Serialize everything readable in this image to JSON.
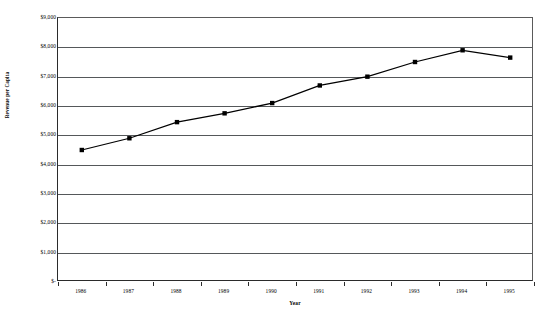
{
  "chart_data": {
    "type": "line",
    "title": "",
    "xlabel": "Year",
    "ylabel": "Revenue per Capita",
    "categories": [
      "1986",
      "1987",
      "1988",
      "1989",
      "1990",
      "1991",
      "1992",
      "1993",
      "1994",
      "1995"
    ],
    "values": [
      4500,
      4900,
      5450,
      5750,
      6100,
      6700,
      7000,
      7500,
      7900,
      7650
    ],
    "series": [
      {
        "name": "Revenue per Capita",
        "values": [
          4500,
          4900,
          5450,
          5750,
          6100,
          6700,
          7000,
          7500,
          7900,
          7650
        ]
      }
    ],
    "ylim": [
      0,
      9000
    ],
    "ytick_values": [
      0,
      1000,
      2000,
      3000,
      4000,
      5000,
      6000,
      7000,
      8000,
      9000
    ],
    "ytick_labels": [
      "$-",
      "$1,000",
      "$2,000",
      "$3,000",
      "$4,000",
      "$5,000",
      "$6,000",
      "$7,000",
      "$8,000",
      "$9,000"
    ],
    "xtick_labels": [
      "1986",
      "1987",
      "1988",
      "1989",
      "1990",
      "1991",
      "1992",
      "1993",
      "1994",
      "1995"
    ],
    "grid": "horizontal",
    "legend": "none",
    "marker": "square",
    "line_color": "#000000",
    "marker_color": "#000000",
    "grid_color": "#55585a",
    "background_color": "#ffffff"
  }
}
